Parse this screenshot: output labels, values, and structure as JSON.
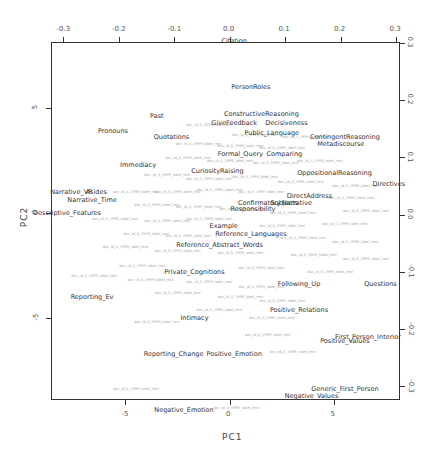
{
  "chart_data": {
    "type": "scatter",
    "subtype": "biplot",
    "title": "",
    "xlabel": "PC1",
    "ylabel": "PC2",
    "xlim": [
      -8.6,
      8.1
    ],
    "ylim": [
      -8.5,
      8.7
    ],
    "secondary_xlim": [
      -0.31,
      0.31
    ],
    "secondary_ylim": [
      -0.31,
      0.32
    ],
    "bottom_ticks": [
      "-5",
      "0",
      "5"
    ],
    "left_ticks": [
      "5",
      "0",
      "-5"
    ],
    "top_ticks": [
      "-0.3",
      "-0.2",
      "-0.1",
      "0.0",
      "0.1",
      "0.2",
      "0.3"
    ],
    "right_ticks": [
      "0.3",
      "0.2",
      "0.1",
      "0.0",
      "-0.1",
      "-0.2",
      "-0.3"
    ],
    "grid": false,
    "legend": "none",
    "variables": [
      {
        "label": "Citation",
        "x": 0.2,
        "y": 8.2
      },
      {
        "label": "PersonRoles",
        "x": 1.0,
        "y": 6.0
      },
      {
        "label": "Past",
        "x": -3.5,
        "y": 4.6
      },
      {
        "label": "ConstructiveReasoning",
        "x": 1.5,
        "y": 4.7
      },
      {
        "label": "GiveFeedback",
        "x": 0.2,
        "y": 4.3
      },
      {
        "label": "Decisiveness",
        "x": 2.7,
        "y": 4.3
      },
      {
        "label": "Pronouns",
        "x": -5.6,
        "y": 3.9
      },
      {
        "label": "Quotations",
        "x": -2.8,
        "y": 3.6
      },
      {
        "label": "Public_Language",
        "x": 2.0,
        "y": 3.8
      },
      {
        "label": "ContingentReasoning",
        "x": 5.5,
        "y": 3.6
      },
      {
        "label": "Metadiscourse",
        "x": 5.3,
        "y": 3.3
      },
      {
        "label": "Formal_Query",
        "x": 0.5,
        "y": 2.8
      },
      {
        "label": "Comparing",
        "x": 2.6,
        "y": 2.8
      },
      {
        "label": "Immediacy",
        "x": -4.4,
        "y": 2.3
      },
      {
        "label": "CuriosityRaising",
        "x": -0.6,
        "y": 2.0
      },
      {
        "label": "OppositionalReasoning",
        "x": 5.0,
        "y": 1.9
      },
      {
        "label": "Directives",
        "x": 7.6,
        "y": 1.4
      },
      {
        "label": "Narrative_VP",
        "x": -7.6,
        "y": 1.0
      },
      {
        "label": "Asides",
        "x": -6.4,
        "y": 1.0
      },
      {
        "label": "Narrative_Time",
        "x": -6.6,
        "y": 0.6
      },
      {
        "label": "DirectAddress",
        "x": 3.8,
        "y": 0.8
      },
      {
        "label": "Confirmatory",
        "x": 1.4,
        "y": 0.5
      },
      {
        "label": "Subjects",
        "x": 2.6,
        "y": 0.5
      },
      {
        "label": "Narrative",
        "x": 3.2,
        "y": 0.5
      },
      {
        "label": "Responsibility",
        "x": 1.1,
        "y": 0.2
      },
      {
        "label": "Descriptive_Features",
        "x": -7.8,
        "y": 0.0
      },
      {
        "label": "Example",
        "x": -0.3,
        "y": -0.6
      },
      {
        "label": "Reference_Languages",
        "x": 1.0,
        "y": -1.0
      },
      {
        "label": "Reference_Abstract_Words",
        "x": -0.5,
        "y": -1.5
      },
      {
        "label": "Private_Cognitions",
        "x": -1.7,
        "y": -2.8
      },
      {
        "label": "Reporting_Ev",
        "x": -6.6,
        "y": -4.0
      },
      {
        "label": "Following_Up",
        "x": 3.3,
        "y": -3.4
      },
      {
        "label": "Questions",
        "x": 7.2,
        "y": -3.4
      },
      {
        "label": "Positive_Relations",
        "x": 3.3,
        "y": -4.6
      },
      {
        "label": "Intimacy",
        "x": -1.7,
        "y": -5.0
      },
      {
        "label": "First_Person_Interior",
        "x": 6.6,
        "y": -5.9
      },
      {
        "label": "Positive_Values",
        "x": 5.5,
        "y": -6.1
      },
      {
        "label": "Reporting_Change",
        "x": -2.7,
        "y": -6.7
      },
      {
        "label": "Positive_Emotion",
        "x": 0.2,
        "y": -6.7
      },
      {
        "label": "Generic_First_Person",
        "x": 5.5,
        "y": -8.4
      },
      {
        "label": "Negative_Values",
        "x": 3.9,
        "y": -8.7
      },
      {
        "label": "Negative_Emotion",
        "x": -2.2,
        "y": -9.4
      }
    ],
    "documents_note": "Dense cloud of small grey document labels (unreadable) concentrated around PC1 -6..8, PC2 -7..4",
    "documents": [
      {
        "label": "doc",
        "x": -1.0,
        "y": 4.2
      },
      {
        "label": "doc",
        "x": 1.2,
        "y": 3.7
      },
      {
        "label": "doc",
        "x": 3.6,
        "y": 3.6
      },
      {
        "label": "doc",
        "x": -1.5,
        "y": 3.3
      },
      {
        "label": "doc",
        "x": 0.5,
        "y": 3.2
      },
      {
        "label": "doc",
        "x": 2.5,
        "y": 3.1
      },
      {
        "label": "doc",
        "x": -2.0,
        "y": 2.6
      },
      {
        "label": "doc",
        "x": 0.0,
        "y": 2.5
      },
      {
        "label": "doc",
        "x": 2.2,
        "y": 2.4
      },
      {
        "label": "doc",
        "x": 4.3,
        "y": 2.5
      },
      {
        "label": "doc",
        "x": -3.0,
        "y": 1.8
      },
      {
        "label": "doc",
        "x": -1.0,
        "y": 1.6
      },
      {
        "label": "doc",
        "x": 1.2,
        "y": 1.7
      },
      {
        "label": "doc",
        "x": 3.4,
        "y": 1.5
      },
      {
        "label": "doc",
        "x": 6.0,
        "y": 1.3
      },
      {
        "label": "doc",
        "x": -4.5,
        "y": 1.0
      },
      {
        "label": "doc",
        "x": -2.5,
        "y": 1.0
      },
      {
        "label": "doc",
        "x": -0.5,
        "y": 1.1
      },
      {
        "label": "doc",
        "x": 1.5,
        "y": 1.0
      },
      {
        "label": "doc",
        "x": 5.8,
        "y": 0.7
      },
      {
        "label": "doc",
        "x": -3.5,
        "y": 0.4
      },
      {
        "label": "doc",
        "x": -1.5,
        "y": 0.3
      },
      {
        "label": "doc",
        "x": 0.6,
        "y": 0.2
      },
      {
        "label": "doc",
        "x": 3.0,
        "y": 0.0
      },
      {
        "label": "doc",
        "x": 6.5,
        "y": 0.1
      },
      {
        "label": "doc",
        "x": -5.5,
        "y": -0.3
      },
      {
        "label": "doc",
        "x": -3.0,
        "y": -0.4
      },
      {
        "label": "doc",
        "x": -1.0,
        "y": -0.3
      },
      {
        "label": "doc",
        "x": 2.5,
        "y": -0.6
      },
      {
        "label": "doc",
        "x": 5.5,
        "y": -0.5
      },
      {
        "label": "doc",
        "x": -4.0,
        "y": -1.0
      },
      {
        "label": "doc",
        "x": -2.0,
        "y": -1.1
      },
      {
        "label": "doc",
        "x": 3.5,
        "y": -1.2
      },
      {
        "label": "doc",
        "x": 6.0,
        "y": -1.4
      },
      {
        "label": "doc",
        "x": -5.0,
        "y": -1.6
      },
      {
        "label": "doc",
        "x": -2.5,
        "y": -1.8
      },
      {
        "label": "doc",
        "x": 0.5,
        "y": -1.9
      },
      {
        "label": "doc",
        "x": 4.0,
        "y": -2.0
      },
      {
        "label": "doc",
        "x": 6.5,
        "y": -2.2
      },
      {
        "label": "doc",
        "x": -4.2,
        "y": -2.5
      },
      {
        "label": "doc",
        "x": 1.5,
        "y": -2.6
      },
      {
        "label": "doc",
        "x": 4.8,
        "y": -2.8
      },
      {
        "label": "doc",
        "x": -6.5,
        "y": -3.0
      },
      {
        "label": "doc",
        "x": -3.8,
        "y": -3.2
      },
      {
        "label": "doc",
        "x": -1.0,
        "y": -3.3
      },
      {
        "label": "doc",
        "x": 1.5,
        "y": -3.5
      },
      {
        "label": "doc",
        "x": -2.5,
        "y": -3.8
      },
      {
        "label": "doc",
        "x": 0.5,
        "y": -4.0
      },
      {
        "label": "doc",
        "x": 2.5,
        "y": -4.2
      },
      {
        "label": "doc",
        "x": -0.5,
        "y": -4.6
      },
      {
        "label": "doc",
        "x": 2.0,
        "y": -5.0
      },
      {
        "label": "doc",
        "x": -3.5,
        "y": -5.2
      },
      {
        "label": "doc",
        "x": 1.8,
        "y": -5.8
      },
      {
        "label": "doc",
        "x": 3.0,
        "y": -6.6
      },
      {
        "label": "doc",
        "x": -4.5,
        "y": -8.4
      },
      {
        "label": "doc",
        "x": 0.3,
        "y": -9.3
      }
    ]
  },
  "axes": {
    "x_title": "PC1",
    "y_title": "PC2"
  }
}
